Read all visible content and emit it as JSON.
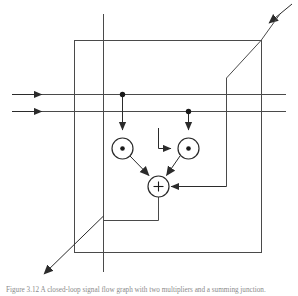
{
  "figure": {
    "kind": "signal-flow-block-diagram",
    "caption": "Figure 3.12  A closed-loop signal flow graph with two multipliers and a summing junction.",
    "canvas": {
      "width": 298,
      "height": 296
    },
    "colors": {
      "line": "#4a4a4a",
      "line_dark": "#2b2b2b",
      "node_fill": "#ffffff",
      "background": "#ffffff",
      "caption": "#8a8a8a"
    },
    "stroke_width": 1
  },
  "geometry": {
    "outer_box": {
      "x": 74,
      "y": 40,
      "width": 187,
      "height": 212,
      "label": "plant-boundary-box"
    },
    "vertical_axis_line": {
      "x": 103,
      "y1": 14,
      "y2": 272,
      "label": "vertical-reference-line"
    },
    "input_lines": [
      {
        "name": "input-line-upper",
        "x1": 12,
        "y1": 94,
        "x2": 286,
        "y2": 94,
        "arrow_x": 40
      },
      {
        "name": "input-line-lower",
        "x1": 12,
        "y1": 111,
        "x2": 286,
        "y2": 111,
        "arrow_x": 40
      }
    ],
    "tap_dots": [
      {
        "name": "tap-dot-upper",
        "cx": 122,
        "cy": 94,
        "r": 2.6
      },
      {
        "name": "tap-dot-lower",
        "cx": 188,
        "cy": 111,
        "r": 2.6
      }
    ],
    "multipliers": [
      {
        "name": "multiplier-left",
        "cx": 122,
        "cy": 148,
        "r": 10.5,
        "dot_r": 2.2,
        "symbol": "dot"
      },
      {
        "name": "multiplier-right",
        "cx": 188,
        "cy": 148,
        "r": 10.5,
        "dot_r": 2.2,
        "symbol": "dot"
      }
    ],
    "summing_junction": {
      "name": "summing-junction",
      "cx": 158,
      "cy": 186,
      "r": 10.5,
      "symbol": "+"
    },
    "drop_lines": [
      {
        "name": "drop-upper-to-multiplier-left",
        "x": 122,
        "y1": 94,
        "y2": 133
      },
      {
        "name": "drop-lower-to-multiplier-right",
        "x": 188,
        "y1": 111,
        "y2": 133
      }
    ],
    "bracket_to_right_multiplier": {
      "name": "bracket-feed-right-multiplier",
      "x_start": 158,
      "y_start": 128,
      "y_corner": 148,
      "x_end": 174
    },
    "diagonal_arrows": [
      {
        "name": "diagonal-arrow-in-top-right",
        "x1": 290,
        "y1": 6,
        "x2": 266,
        "y2": 26,
        "direction": "down-left"
      },
      {
        "name": "diagonal-arrow-out-bottom-left",
        "x1": 103,
        "y1": 216,
        "x2": 41,
        "y2": 277,
        "direction": "down-left"
      }
    ],
    "diagonal_segments": [
      {
        "name": "diagonal-top-right-to-riser",
        "x1": 261,
        "y1": 40,
        "x2": 226,
        "y2": 78
      },
      {
        "name": "riser-top-right",
        "x": 226,
        "y1": 78,
        "y2": 186
      }
    ],
    "feedback_path": {
      "name": "feedback-to-summing-junction",
      "x_from": 226,
      "y": 186,
      "x_to": 172
    },
    "output_path": {
      "name": "output-from-summing-junction",
      "x": 158,
      "y_from": 197,
      "y_to": 220,
      "x_to": 103
    },
    "mixer_links": [
      {
        "name": "link-multiplier-left-to-sum",
        "x1": 130,
        "y1": 156,
        "x2": 150,
        "y2": 177
      },
      {
        "name": "link-multiplier-right-to-sum",
        "x1": 180,
        "y1": 156,
        "x2": 166,
        "y2": 177
      }
    ]
  }
}
